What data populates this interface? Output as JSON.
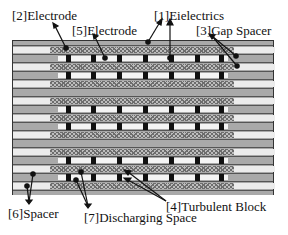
{
  "labels": {
    "electrode_2": "[2]Electrode",
    "electrode_5": "[5]Electrode",
    "dielectrics_1": "[1]Eielectrics",
    "gap_spacer_3": "[3]Gap Spacer",
    "turbulent_block_4": "[4]Turbulent Block",
    "spacer_6": "[6]Spacer",
    "discharging_space_7": "[7]Discharging Space"
  },
  "colors": {
    "dielectric_gray": "#a9a9a9",
    "spacer_white": "#ececec",
    "hatch": "#6d6d6d",
    "block": "#111111"
  }
}
